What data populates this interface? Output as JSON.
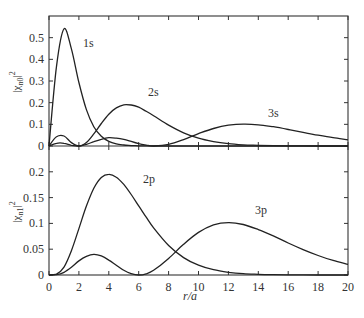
{
  "chart_data": [
    {
      "type": "line",
      "panel": "upper",
      "ylabel": "|χn0|²",
      "ylim": [
        0,
        0.6
      ],
      "yticks": [
        0,
        0.1,
        0.2,
        0.3,
        0.4,
        0.5
      ],
      "ytick_labels": [
        "0",
        "0.1",
        "0.2",
        "0.3",
        "0.4",
        "0.5"
      ],
      "xlim": [
        0,
        20
      ],
      "grid": false,
      "x": [
        0,
        0.5,
        1,
        1.5,
        2,
        2.5,
        3,
        3.5,
        4,
        4.5,
        5,
        5.5,
        6,
        6.5,
        7,
        8,
        9,
        10,
        11,
        12,
        13,
        14,
        15,
        16,
        17,
        18,
        19,
        20
      ],
      "series": [
        {
          "name": "1s",
          "label_pos": [
            83,
            47
          ],
          "values": [
            0,
            0.368,
            0.541,
            0.448,
            0.293,
            0.168,
            0.089,
            0.045,
            0.021,
            0.0099,
            0.0045,
            0.002,
            0.0009,
            0.0004,
            0.0002,
            0,
            0,
            0,
            0,
            0,
            0,
            0,
            0,
            0,
            0,
            0,
            0,
            0
          ]
        },
        {
          "name": "2s",
          "label_pos": [
            148,
            96
          ],
          "values": [
            0,
            0.0426,
            0.046,
            0.0157,
            0,
            0.016,
            0.056,
            0.104,
            0.147,
            0.176,
            0.19,
            0.189,
            0.179,
            0.16,
            0.14,
            0.0966,
            0.061,
            0.0363,
            0.0205,
            0.011,
            0.0057,
            0.0029,
            0.0014,
            0.0007,
            0.0003,
            0.00015,
            0.0001,
            0
          ]
        },
        {
          "name": "3s",
          "label_pos": [
            268,
            117
          ],
          "values": [
            0,
            0.0125,
            0.0126,
            0.0034,
            0.0002,
            0.008,
            0.02,
            0.031,
            0.0383,
            0.036,
            0.0305,
            0.021,
            0.0108,
            0.004,
            0.0001,
            0.0076,
            0.0297,
            0.0571,
            0.0808,
            0.096,
            0.1013,
            0.0979,
            0.0889,
            0.0763,
            0.063,
            0.0498,
            0.0382,
            0.0287
          ]
        }
      ]
    },
    {
      "type": "line",
      "panel": "lower",
      "ylabel": "|χn1|²",
      "xlabel": "r/a",
      "ylim": [
        0,
        0.25
      ],
      "yticks": [
        0,
        0.05,
        0.1,
        0.15,
        0.2
      ],
      "ytick_labels": [
        "0",
        "0.05",
        "0.1",
        "0.15",
        "0.2"
      ],
      "xlim": [
        0,
        20
      ],
      "xticks": [
        0,
        2,
        4,
        6,
        8,
        10,
        12,
        14,
        16,
        18,
        20
      ],
      "xtick_labels": [
        "0",
        "2",
        "4",
        "6",
        "8",
        "10",
        "12",
        "14",
        "16",
        "18",
        "20"
      ],
      "grid": false,
      "x": [
        0,
        0.5,
        1,
        1.5,
        2,
        2.5,
        3,
        3.5,
        4,
        4.5,
        5,
        5.5,
        6,
        6.5,
        7,
        8,
        9,
        10,
        11,
        12,
        13,
        14,
        15,
        16,
        17,
        18,
        19,
        20
      ],
      "series": [
        {
          "name": "2p",
          "label_pos": [
            143,
            183
          ],
          "values": [
            0,
            0.0016,
            0.0153,
            0.047,
            0.09,
            0.1336,
            0.168,
            0.189,
            0.195,
            0.1896,
            0.1755,
            0.156,
            0.134,
            0.112,
            0.0912,
            0.0572,
            0.0337,
            0.0189,
            0.0102,
            0.0053,
            0.0027,
            0.0013,
            0.0006,
            0.0003,
            0.0001,
            0,
            0,
            0
          ]
        },
        {
          "name": "3p",
          "label_pos": [
            255,
            214
          ],
          "values": [
            0,
            0.0005,
            0.0052,
            0.015,
            0.0274,
            0.036,
            0.0401,
            0.037,
            0.0289,
            0.019,
            0.0091,
            0.0025,
            0,
            0.0023,
            0.0092,
            0.0321,
            0.0595,
            0.0826,
            0.097,
            0.1016,
            0.0978,
            0.088,
            0.0757,
            0.062,
            0.0493,
            0.0377,
            0.0282,
            0.0206
          ]
        }
      ]
    }
  ],
  "labels": {
    "xlabel": "r/a",
    "upper_ylabel_main": "|χ",
    "upper_ylabel_sub": "n0",
    "lower_ylabel_main": "|χ",
    "lower_ylabel_sub": "n1",
    "ylabel_tail": "|",
    "ylabel_sup": "2"
  }
}
